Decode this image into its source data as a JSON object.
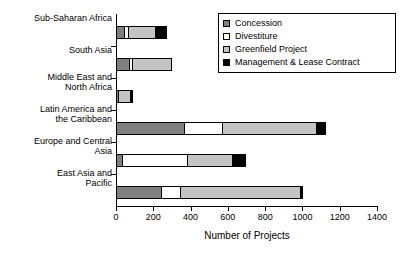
{
  "chart_data": {
    "type": "bar",
    "orientation": "horizontal",
    "stacked": true,
    "title": "",
    "xlabel": "Number of Projects",
    "ylabel": "",
    "xlim": [
      0,
      1400
    ],
    "xticks": [
      0,
      200,
      400,
      600,
      800,
      1000,
      1200,
      1400
    ],
    "grid": false,
    "legend_position": "top-right",
    "categories": [
      "Sub-Saharan Africa",
      "South Asia",
      "Middle East and\nNorth Africa",
      "Latin America and\nthe Caribbean",
      "Europe and Central\nAsia",
      "East Asia and\nPacific"
    ],
    "category_lines": [
      [
        "Sub-Saharan Africa"
      ],
      [
        "South Asia"
      ],
      [
        "Middle East and",
        "North Africa"
      ],
      [
        "Latin America and",
        "the Caribbean"
      ],
      [
        "Europe and Central",
        "Asia"
      ],
      [
        "East Asia and",
        "Pacific"
      ]
    ],
    "series": [
      {
        "name": "Concession",
        "color": "#808080",
        "values": [
          50,
          75,
          15,
          370,
          40,
          245
        ]
      },
      {
        "name": "Divestiture",
        "color": "#ffffff",
        "values": [
          25,
          20,
          0,
          210,
          350,
          110
        ]
      },
      {
        "name": "Greenfield Project",
        "color": "#c4c4c4",
        "values": [
          150,
          215,
          70,
          510,
          250,
          650
        ]
      },
      {
        "name": "Management & Lease Contract",
        "color": "#000000",
        "values": [
          65,
          0,
          15,
          50,
          75,
          15
        ]
      }
    ],
    "totals": [
      290,
      310,
      100,
      1140,
      715,
      1020
    ]
  },
  "legend": {
    "items": [
      {
        "label": "Concession",
        "swatch": "#808080"
      },
      {
        "label": "Divestiture",
        "swatch": "#ffffff"
      },
      {
        "label": "Greenfield Project",
        "swatch": "#c4c4c4"
      },
      {
        "label": "Management & Lease Contract",
        "swatch": "#000000"
      }
    ]
  }
}
